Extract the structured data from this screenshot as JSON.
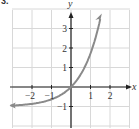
{
  "problem_label": "3.",
  "chart_data": {
    "type": "line",
    "title": "",
    "xlabel": "x",
    "ylabel": "y",
    "xlim": [
      -3,
      3
    ],
    "ylim": [
      -2,
      4
    ],
    "grid": true,
    "x_ticks": [
      "-2",
      "-1",
      "1",
      "2"
    ],
    "y_ticks": [
      "-1",
      "1",
      "2",
      "3"
    ],
    "series": [
      {
        "name": "curve",
        "function": "y = e^x - 1",
        "x": [
          -3,
          -2.5,
          -2,
          -1.5,
          -1,
          -0.5,
          0,
          0.5,
          1,
          1.25,
          1.5
        ],
        "y": [
          -0.95,
          -0.92,
          -0.86,
          -0.78,
          -0.63,
          -0.39,
          0,
          0.65,
          1.72,
          2.49,
          3.48
        ],
        "color": "#8a8a8a",
        "left_arrow": true,
        "right_arrow": true
      }
    ]
  },
  "colors": {
    "grid": "#d8d8d8",
    "axis": "#222222",
    "curve": "#8a8a8a"
  }
}
